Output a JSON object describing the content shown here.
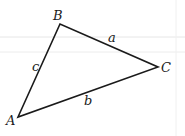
{
  "diagram": {
    "type": "triangle",
    "vertices": [
      {
        "label": "A",
        "x": 18,
        "y": 117
      },
      {
        "label": "B",
        "x": 60,
        "y": 24
      },
      {
        "label": "C",
        "x": 158,
        "y": 67
      }
    ],
    "sides": [
      {
        "label": "a",
        "from": "B",
        "to": "C"
      },
      {
        "label": "b",
        "from": "A",
        "to": "C"
      },
      {
        "label": "c",
        "from": "A",
        "to": "B"
      }
    ],
    "stroke_color": "#1a1a1a"
  },
  "labels": {
    "A": "A",
    "B": "B",
    "C": "C",
    "a": "a",
    "b": "b",
    "c": "c"
  }
}
